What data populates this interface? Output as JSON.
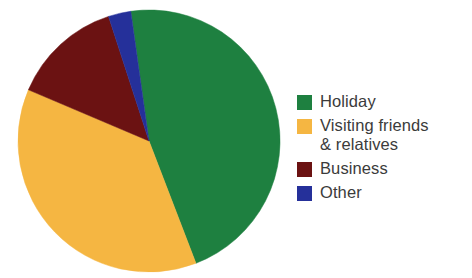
{
  "chart_data": {
    "type": "pie",
    "title": "",
    "subtitle": "",
    "xlabel": "",
    "ylabel": "",
    "legend_position": "right",
    "grid": false,
    "categories": [
      "Holiday",
      "Visiting friends & relatives",
      "Business",
      "Other"
    ],
    "values": [
      46,
      37,
      14,
      3
    ],
    "start_angle_deg": -8,
    "direction": "clockwise",
    "slices": [
      {
        "label": "Holiday",
        "value": 46,
        "color": "#1e8040",
        "start_angle_deg": -8,
        "end_angle_deg": 159
      },
      {
        "label": "Visiting friends & relatives",
        "value": 37,
        "color": "#f5b642",
        "start_angle_deg": 159,
        "end_angle_deg": 293
      },
      {
        "label": "Business",
        "value": 14,
        "color": "#6b1212",
        "start_angle_deg": 293,
        "end_angle_deg": 342
      },
      {
        "label": "Other",
        "value": 3,
        "color": "#25309a",
        "start_angle_deg": 342,
        "end_angle_deg": 352
      }
    ]
  },
  "legend": {
    "items": [
      {
        "label": "Holiday",
        "color": "#1e8040"
      },
      {
        "label": "Visiting friends\n& relatives",
        "color": "#f5b642"
      },
      {
        "label": "Business",
        "color": "#6b1212"
      },
      {
        "label": "Other",
        "color": "#25309a"
      }
    ]
  },
  "colors": {
    "holiday": "#1e8040",
    "visiting_friends_relatives": "#f5b642",
    "business": "#6b1212",
    "other": "#25309a",
    "background": "#ffffff",
    "text": "#3b3b3b"
  },
  "geometry": {
    "center_x": 149,
    "center_y": 141,
    "radius": 131
  }
}
